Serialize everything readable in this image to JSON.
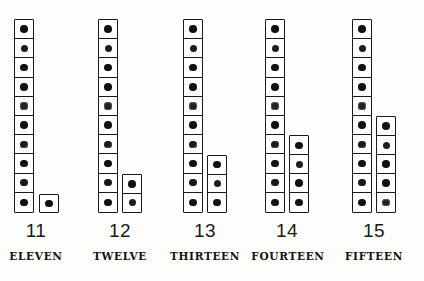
{
  "figure": {
    "ink_color": "#1a1a1a",
    "background_color": "#fdfdfb",
    "dot_color": "#111111"
  },
  "chart_data": {
    "type": "bar",
    "xlabel": "",
    "ylabel": "",
    "grid": false,
    "legend": false,
    "ylim": [
      0,
      15
    ],
    "categories": [
      "11",
      "12",
      "13",
      "14",
      "15"
    ],
    "values": [
      11,
      12,
      13,
      14,
      15
    ],
    "series": [
      {
        "name": "tens column (dots)",
        "values": [
          10,
          10,
          10,
          10,
          10
        ]
      },
      {
        "name": "ones column (dots)",
        "values": [
          1,
          2,
          3,
          4,
          5
        ]
      }
    ]
  },
  "groups": [
    {
      "numeral": "11",
      "word": "ELEVEN",
      "tens_dots": 10,
      "ones_dots": 1,
      "left": 12,
      "main_col_x": 2,
      "ones_col_x": 27,
      "numeral_left": -6,
      "numeral_width": 60,
      "word_left": -12,
      "word_width": 72
    },
    {
      "numeral": "12",
      "word": "TWELVE",
      "tens_dots": 10,
      "ones_dots": 2,
      "left": 96,
      "main_col_x": 2,
      "ones_col_x": 26,
      "numeral_left": -6,
      "numeral_width": 60,
      "word_left": -14,
      "word_width": 76
    },
    {
      "numeral": "13",
      "word": "THIRTEEN",
      "tens_dots": 10,
      "ones_dots": 3,
      "left": 181,
      "main_col_x": 2,
      "ones_col_x": 26,
      "numeral_left": -6,
      "numeral_width": 60,
      "word_left": -20,
      "word_width": 88
    },
    {
      "numeral": "14",
      "word": "FOURTEEN",
      "tens_dots": 10,
      "ones_dots": 4,
      "left": 263,
      "main_col_x": 2,
      "ones_col_x": 26,
      "numeral_left": -6,
      "numeral_width": 60,
      "word_left": -21,
      "word_width": 92
    },
    {
      "numeral": "15",
      "word": "FIFTEEN",
      "tens_dots": 10,
      "ones_dots": 5,
      "left": 350,
      "main_col_x": 2,
      "ones_col_x": 26,
      "numeral_left": -6,
      "numeral_width": 60,
      "word_left": -16,
      "word_width": 80
    }
  ],
  "cell_metrics": {
    "cell_width": 20,
    "cell_height": 19.4
  }
}
